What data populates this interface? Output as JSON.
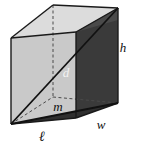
{
  "figure": {
    "shape": "rectangular-prism",
    "projection": "oblique",
    "background_color": "#ffffff"
  },
  "labels": {
    "height": "h",
    "width": "w",
    "length": "ℓ",
    "space_diagonal": "d",
    "base_diagonal": "m"
  },
  "colors": {
    "top_face": "#dcdcdc",
    "left_face": "#c9c9c9",
    "front_face": "#a8a8a8",
    "right_face": "#3a3a3a",
    "bottom_face": "#6e6e6e",
    "edge_stroke": "#1a1a1a",
    "hidden_edge_stroke": "#555555",
    "label_color": "#111111",
    "label_color_on_dark": "#f2f2f2"
  },
  "geometry": {
    "front_bottom_left": [
      11,
      124
    ],
    "front_bottom_right": [
      76,
      118
    ],
    "front_top_left": [
      11,
      38
    ],
    "front_top_right": [
      76,
      32
    ],
    "back_bottom_left": [
      53,
      97
    ],
    "back_bottom_right": [
      118,
      103
    ],
    "back_top_left": [
      53,
      5
    ],
    "back_top_right": [
      118,
      8
    ]
  },
  "label_positions": {
    "height": [
      123,
      47
    ],
    "width": [
      100,
      125
    ],
    "length": [
      42,
      138
    ],
    "space_diagonal": [
      65,
      72
    ],
    "base_diagonal": [
      56,
      106
    ]
  }
}
